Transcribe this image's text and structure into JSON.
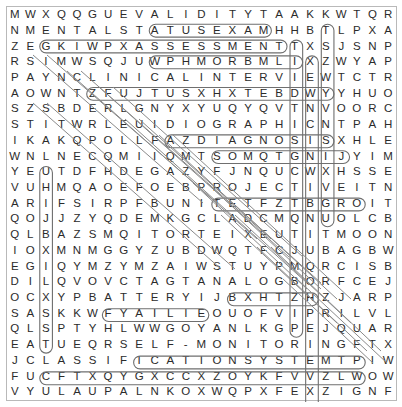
{
  "puzzle": {
    "type": "word-search",
    "rows": 25,
    "cols": 20,
    "cell_width": 19.55,
    "cell_height": 15.8,
    "grid": [
      "MWXQQGUEVALIDITYTAAKKWTQR",
      "NMENTALSTATUSEXAMHHBTLPXA",
      "ZEGKIWPXASSESSMENTTXSJSNP",
      "RSIMWSQJUWPHMORBMLIXZWYAP",
      "PAYNCLINICALINTERVIEWTCTR",
      "AOWNTZFUJTUSXHXTEBDWYYHUO",
      "SZSBDERLGNYXYUQYQVTNVOORC",
      "STITWRLEUIDIOGRAPHICNTPAH",
      "IKAKQPOLLFAZDIAGNOSISXHLE",
      "WNLNECQMIIQMTSOMQTGNIJYIM",
      "YEUTDFHDEGAZYFJNQUCWXHSSE",
      "VUHMQAOEFOEBPROJECTIVEITN",
      "ARIFSIRPFBUNITETFZTBGROIT",
      "QOJJZYQDEMKGCLADCMQNUOLCB",
      "QLBAZSMQITORTEIXEUTITMOON",
      "IOXMNMGGYZUBDWQTFCJUBAGBW",
      "EGIQYMZYMZAIWSTUYPMQRCISB",
      "DILQVOVCTAGTANALOGBORFCEJ",
      "OCXYPBATTERYIJBXHTZHZJARP",
      "SASKKWFYAILIEOUOFVIPRILVL",
      "QLSPTYHLWWGOYANLKGPEJQUAR",
      "EATUEQRSELF-MONITORINGFTX",
      "JCLASSIFICATIONSYSTEMTPIW",
      "FUCFTXQYGXCCXZOYKFVVZLWOW",
      "VYULAUPALNKOXWQPXFEXZIGNF"
    ],
    "grid_rows_as_cells": [
      [
        "M",
        "W",
        "X",
        "Q",
        "Q",
        "G",
        "U",
        "E",
        "V",
        "A",
        "L",
        "I",
        "D",
        "I",
        "T",
        "Y",
        "T",
        "A",
        "A",
        "K"
      ],
      [
        "N",
        "M",
        "E",
        "N",
        "T",
        "A",
        "L",
        "S",
        "T",
        "A",
        "T",
        "U",
        "S",
        "E",
        "X",
        "A",
        "M",
        "H",
        "H",
        "B"
      ],
      [
        "Z",
        "E",
        "G",
        "K",
        "I",
        "W",
        "P",
        "X",
        "A",
        "S",
        "S",
        "E",
        "S",
        "S",
        "M",
        "E",
        "N",
        "T",
        "T",
        "X"
      ],
      [
        "R",
        "S",
        "I",
        "M",
        "W",
        "S",
        "Q",
        "J",
        "U",
        "W",
        "P",
        "H",
        "M",
        "O",
        "R",
        "B",
        "M",
        "L",
        "I",
        "X"
      ],
      [
        "P",
        "A",
        "Y",
        "N",
        "C",
        "L",
        "I",
        "N",
        "I",
        "C",
        "A",
        "L",
        "I",
        "N",
        "T",
        "E",
        "R",
        "V",
        "I",
        "E"
      ],
      [
        "A",
        "O",
        "W",
        "N",
        "T",
        "Z",
        "F",
        "U",
        "J",
        "T",
        "U",
        "S",
        "X",
        "H",
        "X",
        "T",
        "E",
        "B",
        "D",
        "W"
      ],
      [
        "S",
        "Z",
        "S",
        "B",
        "D",
        "E",
        "R",
        "L",
        "G",
        "N",
        "Y",
        "X",
        "Y",
        "U",
        "Q",
        "Y",
        "Q",
        "V",
        "T",
        "N"
      ],
      [
        "S",
        "T",
        "I",
        "T",
        "W",
        "R",
        "L",
        "E",
        "U",
        "I",
        "D",
        "I",
        "O",
        "G",
        "R",
        "A",
        "P",
        "H",
        "I",
        "C"
      ],
      [
        "I",
        "K",
        "A",
        "K",
        "Q",
        "P",
        "O",
        "L",
        "L",
        "F",
        "A",
        "Z",
        "D",
        "I",
        "A",
        "G",
        "N",
        "O",
        "S",
        "I"
      ],
      [
        "W",
        "N",
        "L",
        "N",
        "E",
        "C",
        "Q",
        "M",
        "I",
        "I",
        "Q",
        "M",
        "T",
        "S",
        "O",
        "M",
        "Q",
        "T",
        "G",
        "N"
      ],
      [
        "Y",
        "E",
        "U",
        "T",
        "D",
        "F",
        "H",
        "D",
        "E",
        "G",
        "A",
        "Z",
        "Y",
        "F",
        "J",
        "N",
        "Q",
        "U",
        "C",
        "W"
      ],
      [
        "V",
        "U",
        "H",
        "M",
        "Q",
        "A",
        "O",
        "E",
        "F",
        "O",
        "E",
        "B",
        "P",
        "R",
        "O",
        "J",
        "E",
        "C",
        "T",
        "I"
      ],
      [
        "A",
        "R",
        "I",
        "F",
        "S",
        "I",
        "R",
        "P",
        "F",
        "B",
        "U",
        "N",
        "I",
        "T",
        "E",
        "T",
        "F",
        "Z",
        "T",
        "B"
      ],
      [
        "Q",
        "O",
        "J",
        "J",
        "Z",
        "Y",
        "Q",
        "D",
        "E",
        "M",
        "K",
        "G",
        "C",
        "L",
        "A",
        "D",
        "C",
        "M",
        "Q",
        "N"
      ],
      [
        "Q",
        "L",
        "B",
        "A",
        "Z",
        "S",
        "M",
        "Q",
        "I",
        "T",
        "O",
        "R",
        "T",
        "E",
        "I",
        "X",
        "E",
        "U",
        "T",
        "I"
      ],
      [
        "I",
        "O",
        "X",
        "M",
        "N",
        "M",
        "G",
        "G",
        "Y",
        "Z",
        "U",
        "B",
        "D",
        "W",
        "Q",
        "T",
        "F",
        "C",
        "J",
        "U"
      ],
      [
        "E",
        "G",
        "I",
        "Q",
        "Y",
        "M",
        "Z",
        "Y",
        "M",
        "Z",
        "A",
        "I",
        "W",
        "S",
        "T",
        "U",
        "Y",
        "P",
        "M",
        "Q"
      ],
      [
        "D",
        "I",
        "L",
        "Q",
        "V",
        "O",
        "V",
        "C",
        "T",
        "A",
        "G",
        "T",
        "A",
        "N",
        "A",
        "L",
        "O",
        "G",
        "B",
        "O"
      ],
      [
        "O",
        "C",
        "X",
        "Y",
        "P",
        "B",
        "A",
        "T",
        "T",
        "E",
        "R",
        "Y",
        "I",
        "J",
        "B",
        "X",
        "H",
        "T",
        "Z",
        "H"
      ],
      [
        "S",
        "A",
        "S",
        "K",
        "K",
        "W",
        "F",
        "Y",
        "A",
        "I",
        "L",
        "I",
        "E",
        "O",
        "U",
        "O",
        "F",
        "V",
        "I",
        "P"
      ],
      [
        "Q",
        "L",
        "S",
        "P",
        "T",
        "Y",
        "H",
        "L",
        "W",
        "W",
        "G",
        "O",
        "Y",
        "A",
        "N",
        "L",
        "K",
        "G",
        "P",
        "E"
      ],
      [
        "E",
        "A",
        "T",
        "U",
        "E",
        "Q",
        "R",
        "S",
        "E",
        "L",
        "F",
        "-",
        "M",
        "O",
        "N",
        "I",
        "T",
        "O",
        "R",
        "I"
      ],
      [
        "J",
        "C",
        "L",
        "A",
        "S",
        "S",
        "I",
        "F",
        "I",
        "C",
        "A",
        "T",
        "I",
        "O",
        "N",
        "S",
        "Y",
        "S",
        "T",
        "E"
      ],
      [
        "F",
        "U",
        "C",
        "F",
        "T",
        "X",
        "Q",
        "Y",
        "G",
        "X",
        "C",
        "C",
        "X",
        "Z",
        "O",
        "Y",
        "K",
        "F",
        "V",
        "V"
      ],
      [
        "V",
        "Y",
        "U",
        "L",
        "A",
        "U",
        "P",
        "A",
        "L",
        "N",
        "K",
        "O",
        "X",
        "W",
        "Q",
        "P",
        "X",
        "F",
        "E",
        "X"
      ]
    ],
    "extra_cols": [
      [
        "W",
        "T",
        "Q",
        "R"
      ],
      [
        "B",
        "T",
        "L",
        "P",
        "X",
        "A"
      ],
      [
        "S",
        "J",
        "S",
        "N",
        "P"
      ],
      [
        "Z",
        "W",
        "Y",
        "A",
        "P"
      ],
      [
        "W",
        "T",
        "C",
        "T",
        "R"
      ],
      [
        "Y",
        "Y",
        "H",
        "U",
        "O"
      ],
      [
        "V",
        "O",
        "O",
        "R",
        "C"
      ],
      [
        "N",
        "T",
        "P",
        "A",
        "H"
      ],
      [
        "S",
        "X",
        "H",
        "L",
        "E"
      ],
      [
        "I",
        "J",
        "Y",
        "I",
        "M"
      ],
      [
        "X",
        "H",
        "S",
        "S",
        "E"
      ],
      [
        "V",
        "E",
        "I",
        "T",
        "N"
      ],
      [
        "G",
        "R",
        "O",
        "I",
        "T"
      ],
      [
        "U",
        "O",
        "L",
        "C",
        "B"
      ],
      [
        "T",
        "M",
        "O",
        "O",
        "N"
      ],
      [
        "B",
        "A",
        "G",
        "B",
        "W"
      ],
      [
        "R",
        "C",
        "I",
        "S",
        "B"
      ],
      [
        "R",
        "F",
        "C",
        "E",
        "J"
      ],
      [
        "Z",
        "J",
        "A",
        "R",
        "P"
      ],
      [
        "R",
        "I",
        "L",
        "V",
        "L"
      ],
      [
        "J",
        "Q",
        "U",
        "A",
        "R"
      ],
      [
        "N",
        "G",
        "F",
        "T",
        "X"
      ],
      [
        "M",
        "T",
        "P",
        "I",
        "W"
      ],
      [
        "Z",
        "L",
        "W",
        "O",
        "W"
      ],
      [
        "Z",
        "I",
        "G",
        "N",
        "F"
      ]
    ],
    "found_words": [
      {
        "word": "VALIDITY",
        "orientation": "horizontal",
        "row": 1,
        "start_col": 9,
        "end_col": 16
      },
      {
        "word": "MENTAL STATUS EXAM",
        "orientation": "horizontal",
        "row": 2,
        "start_col": 2,
        "end_col": 17
      },
      {
        "word": "ASSESSMENT",
        "orientation": "horizontal",
        "row": 3,
        "start_col": 9,
        "end_col": 18
      },
      {
        "word": "CLINICAL INTERVIEW",
        "orientation": "horizontal",
        "row": 5,
        "start_col": 5,
        "end_col": 20
      },
      {
        "word": "IDIOGRAPHIC",
        "orientation": "horizontal",
        "row": 8,
        "start_col": 10,
        "end_col": 20
      },
      {
        "word": "DIAGNOSIS",
        "orientation": "horizontal",
        "row": 9,
        "start_col": 13,
        "end_col": 21
      },
      {
        "word": "PROJECTIVE",
        "orientation": "horizontal",
        "row": 12,
        "start_col": 13,
        "end_col": 22
      },
      {
        "word": "ANALOG",
        "orientation": "horizontal",
        "row": 18,
        "start_col": 14,
        "end_col": 19
      },
      {
        "word": "BATTERY",
        "orientation": "horizontal",
        "row": 19,
        "start_col": 6,
        "end_col": 12
      },
      {
        "word": "SELF-MONITORING",
        "orientation": "horizontal",
        "row": 22,
        "start_col": 8,
        "end_col": 22
      },
      {
        "word": "CLASSIFICATION SYSTEM",
        "orientation": "horizontal",
        "row": 23,
        "start_col": 2,
        "end_col": 22
      },
      {
        "word": "NEUROLOGICAL",
        "orientation": "vertical",
        "col": 2,
        "start_row": 10,
        "end_row": 21
      },
      {
        "word": "PSYCHOPHYSIOLOGICAL",
        "orientation": "vertical",
        "col": 18,
        "start_row": 2,
        "end_row": 20
      },
      {
        "word": "NATURALISTIC OBSERVATION",
        "orientation": "vertical",
        "col": 19,
        "start_row": 3,
        "end_row": 25
      },
      {
        "word": "RAPPROCHEMENT",
        "orientation": "vertical",
        "col": 20,
        "start_row": 1,
        "end_row": 13
      },
      {
        "word": "STANDARDIZATION",
        "orientation": "diagonal",
        "note": "upper-left to lower-right diagonal band"
      },
      {
        "word": "INTERVIEW",
        "orientation": "diagonal",
        "note": "diagonal band"
      },
      {
        "word": "RELIABILITY",
        "orientation": "diagonal",
        "note": "diagonal band"
      },
      {
        "word": "TEST",
        "orientation": "diagonal",
        "note": "diagonal band"
      },
      {
        "word": "NORM",
        "orientation": "diagonal",
        "note": "diagonal band"
      }
    ]
  },
  "colors": {
    "grid_border": "#b9b9b9",
    "letter": "#2b2b2b",
    "mark_stroke": "#6f6f6f",
    "diag_stroke": "#8a8a8a",
    "page_background": "#ffffff"
  }
}
